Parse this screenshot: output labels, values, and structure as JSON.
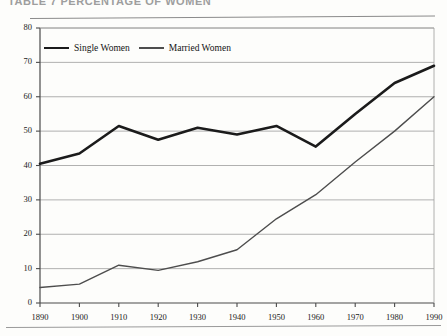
{
  "page": {
    "title_partial": "TABLE 7   PERCENTAGE OF WOMEN",
    "footer_smudge": "",
    "ghost_left": ""
  },
  "chart_data": {
    "type": "line",
    "title": "TABLE 7   PERCENTAGE OF WOMEN",
    "xlabel": "",
    "ylabel": "",
    "categories": [
      "1890",
      "1900",
      "1910",
      "1920",
      "1930",
      "1940",
      "1950",
      "1960",
      "1970",
      "1980",
      "1990"
    ],
    "x": [
      1890,
      1900,
      1910,
      1920,
      1930,
      1940,
      1950,
      1960,
      1970,
      1980,
      1990
    ],
    "xlim": [
      1890,
      1990
    ],
    "ylim": [
      0,
      80
    ],
    "yticks": [
      0,
      10,
      20,
      30,
      40,
      50,
      60,
      70,
      80
    ],
    "ytick_labels": [
      "0",
      "10",
      "20",
      "30",
      "40",
      "50",
      "60",
      "70",
      "80"
    ],
    "grid": true,
    "grid_axis": "y",
    "legend_position": "upper-left-inside",
    "series": [
      {
        "name": "Single Women",
        "color": "#1b1b1b",
        "line_width": 2.6,
        "values": [
          40.5,
          43.5,
          51.5,
          47.5,
          51.0,
          49.0,
          51.5,
          45.5,
          55.0,
          64.0,
          69.0
        ]
      },
      {
        "name": "Married Women",
        "color": "#4d4d4d",
        "line_width": 1.4,
        "values": [
          4.5,
          5.5,
          11.0,
          9.5,
          12.0,
          15.5,
          24.5,
          31.5,
          41.0,
          50.0,
          60.0
        ]
      }
    ]
  }
}
